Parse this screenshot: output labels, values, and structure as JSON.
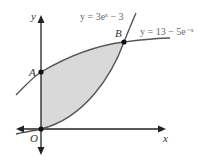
{
  "diagram": {
    "axes": {
      "x_label": "x",
      "y_label": "y",
      "origin_label": "O"
    },
    "curves": [
      {
        "name": "exp-curve",
        "equation": "y = 3eˣ − 3"
      },
      {
        "name": "decay-curve",
        "equation": "y = 13 − 5e⁻ˣ"
      }
    ],
    "points": [
      {
        "label": "A",
        "description": "intersection of y = 13 - 5e^-x with y-axis"
      },
      {
        "label": "B",
        "description": "intersection of the two curves"
      },
      {
        "label": "O",
        "description": "origin"
      }
    ],
    "shaded_region": "region bounded by the y-axis and the two curves",
    "colors": {
      "axis": "#222222",
      "curve": "#555555",
      "shade": "#d9d9d9"
    }
  }
}
